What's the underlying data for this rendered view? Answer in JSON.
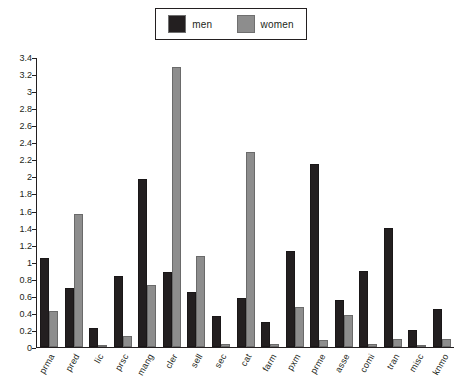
{
  "legend": {
    "position": "top-center",
    "entries": [
      {
        "label": "men",
        "color": "#231f20",
        "swatch_name": "legend-swatch-men"
      },
      {
        "label": "women",
        "color": "#8d8d8d",
        "swatch_name": "legend-swatch-women"
      }
    ]
  },
  "axes": {
    "y_ticks": [
      "0",
      "0.2",
      "0.4",
      "0.6",
      "0.8",
      "1",
      "1.2",
      "1.4",
      "1.6",
      "1.8",
      "2",
      "2.2",
      "2.4",
      "2.6",
      "2.8",
      "3",
      "3.2",
      "3.4"
    ],
    "y_min": 0,
    "y_max": 3.4,
    "y_step": 0.2,
    "x_labels": [
      "prma",
      "pred",
      "lic",
      "prsc",
      "mang",
      "cler",
      "sell",
      "sec",
      "cat",
      "farm",
      "pxm",
      "prme",
      "asse",
      "comi",
      "tran",
      "misc",
      "knmo"
    ]
  },
  "chart_data": {
    "type": "bar",
    "title": "",
    "subtitle": "",
    "xlabel": "",
    "ylabel": "",
    "ylim": [
      0,
      3.4
    ],
    "ytick_step": 0.2,
    "grid": false,
    "legend_position": "top-center",
    "categories": [
      "prma",
      "pred",
      "lic",
      "prsc",
      "mang",
      "cler",
      "sell",
      "sec",
      "cat",
      "farm",
      "pxm",
      "prme",
      "asse",
      "comi",
      "tran",
      "misc",
      "knmo"
    ],
    "series": [
      {
        "name": "men",
        "color": "#231f20",
        "values": [
          1.05,
          0.7,
          0.22,
          0.83,
          1.98,
          0.88,
          0.65,
          0.37,
          0.58,
          0.3,
          1.13,
          2.15,
          0.55,
          0.9,
          1.4,
          0.2,
          0.45
        ]
      },
      {
        "name": "women",
        "color": "#8d8d8d",
        "values": [
          0.42,
          1.57,
          0.02,
          0.13,
          0.73,
          3.3,
          1.07,
          0.03,
          2.3,
          0.03,
          0.47,
          0.08,
          0.38,
          0.03,
          0.1,
          0.02,
          0.1
        ]
      }
    ]
  }
}
